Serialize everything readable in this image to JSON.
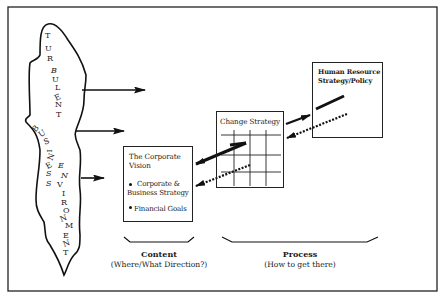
{
  "diagram": {
    "environment": {
      "label_word1": "TURBULENT",
      "label_word2": "BUSINESS",
      "label_word3": "ENVIRONMENT",
      "letters_turbulent": [
        "T",
        "U",
        "R",
        "B",
        "U",
        "L",
        "E",
        "N",
        "T"
      ],
      "letters_business": [
        "B",
        "U",
        "S",
        "I",
        "N",
        "E",
        "S",
        "S"
      ],
      "letters_environment": [
        "E",
        "N",
        "V",
        "I",
        "R",
        "O",
        "N",
        "M",
        "E",
        "N",
        "T"
      ]
    },
    "corporate_vision": {
      "title_line1": "The Corporate",
      "title_line2": "Vision",
      "bullets": [
        {
          "line1": "Corporate &",
          "line2": "Business Strategy"
        },
        {
          "line1": "Financial Goals"
        }
      ]
    },
    "change_strategy": {
      "title": "Change Strategy"
    },
    "hr_strategy": {
      "title_line1": "Human Resource",
      "title_line2": "Strategy/Policy"
    },
    "captions": {
      "content": {
        "title": "Content",
        "subtitle": "(Where/What Direction?)"
      },
      "process": {
        "title": "Process",
        "subtitle": "(How to get there)"
      }
    },
    "colors": {
      "ink": "#1a1a1a",
      "background": "#ffffff"
    }
  }
}
